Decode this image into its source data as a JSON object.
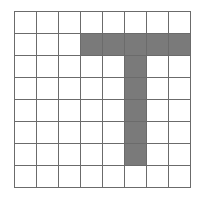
{
  "grid": {
    "rows": 8,
    "cols": 8,
    "cell_size_px": 22,
    "line_color": "#6b6b6b",
    "empty_color": "#ffffff",
    "filled_color": "#7a7a7a",
    "filled_cells": [
      [
        1,
        3
      ],
      [
        1,
        4
      ],
      [
        1,
        5
      ],
      [
        1,
        6
      ],
      [
        1,
        7
      ],
      [
        2,
        5
      ],
      [
        3,
        5
      ],
      [
        4,
        5
      ],
      [
        5,
        5
      ],
      [
        6,
        5
      ]
    ],
    "shape": "T-shape"
  }
}
